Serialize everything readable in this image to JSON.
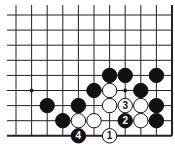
{
  "diagram": {
    "type": "go-board-fragment",
    "corner": "bottom-right",
    "grid": {
      "cols": 11,
      "rows": 9,
      "x0": 16,
      "dx": 15.6,
      "y0": 15,
      "dy": 15.1,
      "line_left_extend": 7,
      "line_top_extend": 5
    },
    "colors": {
      "line": "#222222",
      "black_stone": "#111111",
      "white_stone": "#ffffff",
      "background": "#ffffff"
    },
    "star_points": [
      {
        "col": 1,
        "row": 5
      },
      {
        "col": 7,
        "row": 5
      }
    ],
    "stones": [
      {
        "col": 6,
        "row": 4,
        "color": "black"
      },
      {
        "col": 7,
        "row": 4,
        "color": "black"
      },
      {
        "col": 9,
        "row": 4,
        "color": "black"
      },
      {
        "col": 5,
        "row": 5,
        "color": "black"
      },
      {
        "col": 6,
        "row": 5,
        "color": "white"
      },
      {
        "col": 8,
        "row": 5,
        "color": "black"
      },
      {
        "col": 2,
        "row": 6,
        "color": "black"
      },
      {
        "col": 4,
        "row": 6,
        "color": "black"
      },
      {
        "col": 6,
        "row": 6,
        "color": "white"
      },
      {
        "col": 7,
        "row": 6,
        "color": "white",
        "label": "3"
      },
      {
        "col": 8,
        "row": 6,
        "color": "white"
      },
      {
        "col": 9,
        "row": 6,
        "color": "black"
      },
      {
        "col": 3,
        "row": 7,
        "color": "black"
      },
      {
        "col": 4,
        "row": 7,
        "color": "white"
      },
      {
        "col": 5,
        "row": 7,
        "color": "white"
      },
      {
        "col": 7,
        "row": 7,
        "color": "black",
        "label": "2"
      },
      {
        "col": 8,
        "row": 7,
        "color": "white"
      },
      {
        "col": 9,
        "row": 7,
        "color": "black"
      },
      {
        "col": 4,
        "row": 8,
        "color": "black",
        "label": "4"
      },
      {
        "col": 6,
        "row": 8,
        "color": "white",
        "label": "1"
      }
    ]
  }
}
